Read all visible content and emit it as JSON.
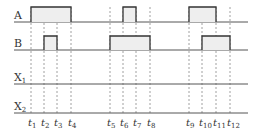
{
  "diagram": {
    "type": "timing-diagram",
    "signals": [
      {
        "name": "A",
        "label": "A",
        "baseline_y": 22,
        "high_y": 7,
        "pulses": [
          [
            "t1",
            "t4"
          ],
          [
            "t6",
            "t7"
          ],
          [
            "t9",
            "t11"
          ]
        ]
      },
      {
        "name": "B",
        "label": "B",
        "baseline_y": 50,
        "high_y": 36,
        "pulses": [
          [
            "t2",
            "t3"
          ],
          [
            "t5",
            "t8"
          ],
          [
            "t10",
            "t12"
          ]
        ]
      },
      {
        "name": "X1",
        "label": "X",
        "subscript": "1",
        "baseline_y": 84,
        "pulses": []
      },
      {
        "name": "X2",
        "label": "X",
        "subscript": "2",
        "baseline_y": 113,
        "pulses": []
      }
    ],
    "times": [
      {
        "id": "t1",
        "label": "t",
        "sub": "1",
        "x": 31
      },
      {
        "id": "t2",
        "label": "t",
        "sub": "2",
        "x": 44
      },
      {
        "id": "t3",
        "label": "t",
        "sub": "3",
        "x": 57
      },
      {
        "id": "t4",
        "label": "t",
        "sub": "4",
        "x": 71
      },
      {
        "id": "t5",
        "label": "t",
        "sub": "5",
        "x": 110
      },
      {
        "id": "t6",
        "label": "t",
        "sub": "6",
        "x": 123
      },
      {
        "id": "t7",
        "label": "t",
        "sub": "7",
        "x": 136
      },
      {
        "id": "t8",
        "label": "t",
        "sub": "8",
        "x": 150
      },
      {
        "id": "t9",
        "label": "t",
        "sub": "9",
        "x": 189
      },
      {
        "id": "t10",
        "label": "t",
        "sub": "10",
        "x": 202
      },
      {
        "id": "t11",
        "label": "t",
        "sub": "11",
        "x": 216
      },
      {
        "id": "t12",
        "label": "t",
        "sub": "12",
        "x": 230
      }
    ],
    "line_start_x": 14,
    "line_end_x": 248,
    "colors": {
      "line": "#555555",
      "pulse_fill": "#eeeeee",
      "pulse_stroke": "#333333",
      "dash": "#888888"
    }
  }
}
